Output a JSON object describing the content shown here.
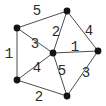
{
  "canvas": {
    "width": 106,
    "height": 106,
    "background": "#ffffff"
  },
  "colors": {
    "node_fill": "#141414",
    "edge_stroke": "#4d4d4d",
    "label_color": "#2b2b2b"
  },
  "chart_data": {
    "type": "graph-diagram",
    "title": "",
    "node_radius": 3.4,
    "nodes": [
      {
        "id": "top",
        "x": 67,
        "y": 11
      },
      {
        "id": "upper-left",
        "x": 17,
        "y": 28
      },
      {
        "id": "center",
        "x": 53,
        "y": 53
      },
      {
        "id": "right",
        "x": 98,
        "y": 51
      },
      {
        "id": "bottom-left",
        "x": 17,
        "y": 80
      },
      {
        "id": "bottom",
        "x": 67,
        "y": 96
      }
    ],
    "edges": [
      {
        "from": "upper-left",
        "to": "top",
        "weight": "5",
        "label_x": 37,
        "label_y": 15
      },
      {
        "from": "top",
        "to": "center",
        "weight": "2",
        "label_x": 56,
        "label_y": 36
      },
      {
        "from": "top",
        "to": "right",
        "weight": "4",
        "label_x": 89,
        "label_y": 35
      },
      {
        "from": "upper-left",
        "to": "center",
        "weight": "3",
        "label_x": 35,
        "label_y": 48
      },
      {
        "from": "upper-left",
        "to": "bottom-left",
        "weight": "1",
        "label_x": 9,
        "label_y": 58
      },
      {
        "from": "center",
        "to": "right",
        "weight": "1",
        "label_x": 75,
        "label_y": 51
      },
      {
        "from": "center",
        "to": "bottom-left",
        "weight": "4",
        "label_x": 37,
        "label_y": 72
      },
      {
        "from": "center",
        "to": "bottom",
        "weight": "5",
        "label_x": 62,
        "label_y": 75
      },
      {
        "from": "bottom-left",
        "to": "bottom",
        "weight": "2",
        "label_x": 39,
        "label_y": 101
      },
      {
        "from": "bottom",
        "to": "right",
        "weight": "3",
        "label_x": 86,
        "label_y": 77
      }
    ]
  }
}
